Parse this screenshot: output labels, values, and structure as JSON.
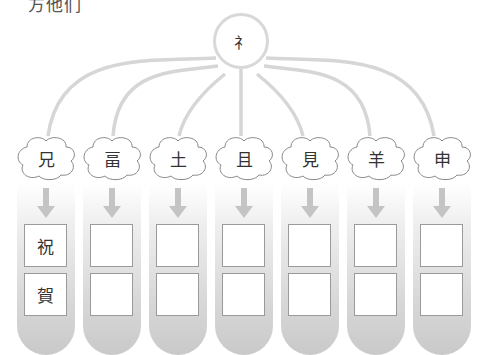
{
  "title": "方他们",
  "hub": {
    "label": "礻"
  },
  "columns": [
    {
      "component": "兄",
      "answers": [
        "祝",
        "賀"
      ]
    },
    {
      "component": "畐",
      "answers": [
        "",
        ""
      ]
    },
    {
      "component": "土",
      "answers": [
        "",
        ""
      ]
    },
    {
      "component": "且",
      "answers": [
        "",
        ""
      ]
    },
    {
      "component": "見",
      "answers": [
        "",
        ""
      ]
    },
    {
      "component": "羊",
      "answers": [
        "",
        ""
      ]
    },
    {
      "component": "申",
      "answers": [
        "",
        ""
      ]
    }
  ],
  "colors": {
    "line": "#d6d6d6",
    "arrow": "#c4c4c4",
    "box_border": "#9a9a9a"
  }
}
